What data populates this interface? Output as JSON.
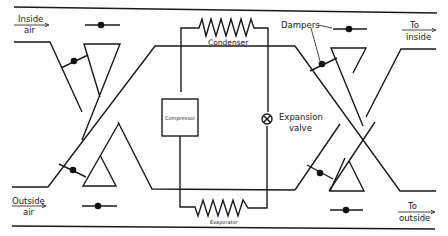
{
  "diagram": {
    "type": "heat-pump ventilation damper schematic",
    "page_mark": "",
    "labels": {
      "inside_air_line1": "Inside",
      "inside_air_line2": "air",
      "outside_air_line1": "Outside",
      "outside_air_line2": "air",
      "to_inside_line1": "To",
      "to_inside_line2": "inside",
      "to_outside_line1": "To",
      "to_outside_line2": "outside",
      "dampers": "Dampers",
      "condenser": "Condenser",
      "evaporator": "Evaporator",
      "compressor": "Compressor",
      "expansion_valve_line1": "Expansion",
      "expansion_valve_line2": "valve"
    },
    "components": [
      {
        "id": "compressor",
        "shape": "rectangle"
      },
      {
        "id": "condenser",
        "shape": "zigzag-coil"
      },
      {
        "id": "evaporator",
        "shape": "zigzag-coil"
      },
      {
        "id": "expansion-valve",
        "shape": "circle-x"
      },
      {
        "id": "dampers",
        "count": 8,
        "shape": "line-with-dot"
      }
    ],
    "colors": {
      "line": "#1a1a1a",
      "background": "#fefefe"
    }
  }
}
